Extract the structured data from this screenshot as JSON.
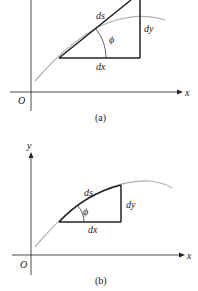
{
  "figure_a": {
    "caption": "(a)",
    "labels": {
      "ds": "ds",
      "dy": "dy",
      "dx": "dx",
      "phi": "ϕ",
      "origin": "O",
      "x_axis": "x"
    },
    "description": "Tangent line segment ds approximating curve; right triangle with legs dx, dy and angle phi"
  },
  "figure_b": {
    "caption": "(b)",
    "labels": {
      "ds": "ds",
      "dy": "dy",
      "dx": "dx",
      "phi": "ϕ",
      "origin": "O",
      "x_axis": "x",
      "y_axis": "y"
    },
    "description": "Arc segment ds along curve; right triangle with legs dx, dy and angle phi"
  },
  "colors": {
    "ink": "#222222",
    "curve": "#b0b0b0"
  }
}
